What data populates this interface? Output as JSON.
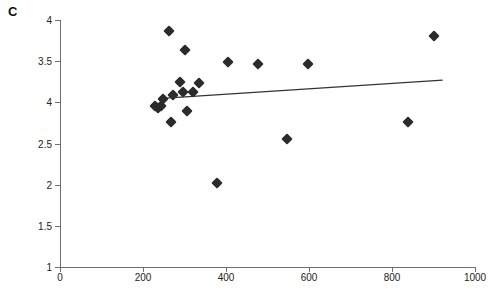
{
  "panel": {
    "label": "C"
  },
  "chart_data": {
    "type": "scatter",
    "title": "",
    "xlabel": "",
    "ylabel": "",
    "xlim": [
      0,
      1000
    ],
    "ylim": [
      1,
      4
    ],
    "grid": false,
    "legend": null,
    "marker_shape": "diamond",
    "marker_color": "#2b2b2b",
    "trendline_color": "#333333",
    "x_ticks": [
      0,
      200,
      400,
      600,
      800,
      1000
    ],
    "x_tick_labels": [
      "0",
      "200",
      "400",
      "600",
      "800",
      "1000"
    ],
    "y_ticks": [
      4,
      3.5,
      3,
      2.5,
      2,
      1.5,
      1
    ],
    "y_tick_labels": [
      "4",
      "3.5",
      "4",
      "2.5",
      "2",
      "1.5",
      "1"
    ],
    "points": [
      {
        "x": 228,
        "y": 2.96
      },
      {
        "x": 236,
        "y": 2.93
      },
      {
        "x": 243,
        "y": 2.95
      },
      {
        "x": 247,
        "y": 3.04
      },
      {
        "x": 262,
        "y": 3.87
      },
      {
        "x": 268,
        "y": 2.76
      },
      {
        "x": 272,
        "y": 3.09
      },
      {
        "x": 288,
        "y": 3.25
      },
      {
        "x": 296,
        "y": 3.13
      },
      {
        "x": 300,
        "y": 3.63
      },
      {
        "x": 305,
        "y": 2.89
      },
      {
        "x": 320,
        "y": 3.12
      },
      {
        "x": 336,
        "y": 3.23
      },
      {
        "x": 378,
        "y": 2.02
      },
      {
        "x": 404,
        "y": 3.49
      },
      {
        "x": 476,
        "y": 3.46
      },
      {
        "x": 548,
        "y": 2.56
      },
      {
        "x": 598,
        "y": 3.47
      },
      {
        "x": 838,
        "y": 2.76
      },
      {
        "x": 900,
        "y": 3.81
      }
    ],
    "trendline": {
      "x_start": 255,
      "y_start": 3.05,
      "x_end": 922,
      "y_end": 3.27
    }
  }
}
